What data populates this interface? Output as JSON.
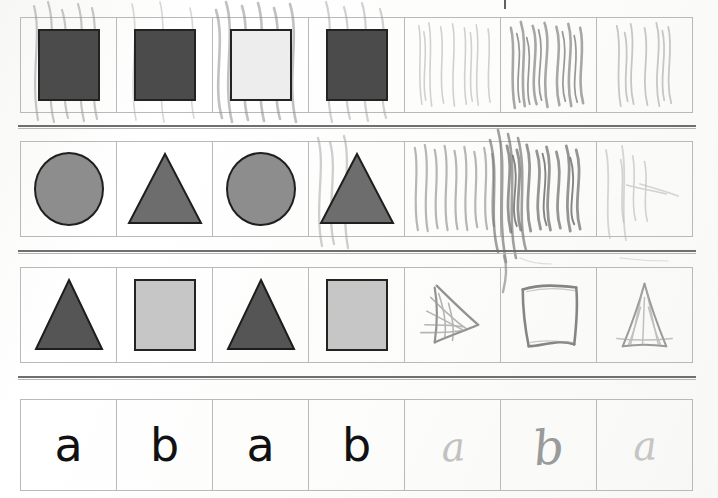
{
  "document": {
    "type": "scanned-worksheet",
    "title": "AB Pattern Practice Worksheet",
    "description": "Scanned student worksheet with four pattern rows of seven cells each; first four cells are printed pattern shapes or letters, last three are hand-drawn pencil answers."
  },
  "colors": {
    "shape_dark": "#4b4b4b",
    "shape_mid": "#8d8d8d",
    "shape_light": "#c6c6c6",
    "triangle_dark": "#555555",
    "triangle_mid": "#6d6d6d",
    "grid_line": "#b9b9b9",
    "separator_line": "#6f6f6f",
    "pencil": "#9a9a9a",
    "letter_ink": "#111111",
    "paper": "#ffffff"
  },
  "rows": [
    {
      "id": "row-squares",
      "name": "square-pattern-row",
      "pattern": "AB",
      "cells": [
        {
          "kind": "square",
          "fill": "dark",
          "label": "dark square",
          "student": false,
          "scribbled": true
        },
        {
          "kind": "square",
          "fill": "dark",
          "label": "dark square",
          "student": false,
          "scribbled": false
        },
        {
          "kind": "square",
          "fill": "scribbled",
          "label": "square covered in pencil scribble",
          "student": false,
          "scribbled": true
        },
        {
          "kind": "square",
          "fill": "dark",
          "label": "dark square",
          "student": false,
          "scribbled": true
        },
        {
          "kind": "scribble",
          "fill": "none",
          "label": "light pencil scribble",
          "student": true,
          "scribbled": true
        },
        {
          "kind": "scribble",
          "fill": "none",
          "label": "heavy pencil scribble",
          "student": true,
          "scribbled": true
        },
        {
          "kind": "scribble",
          "fill": "none",
          "label": "light pencil scribble",
          "student": true,
          "scribbled": true
        }
      ]
    },
    {
      "id": "row-circle-triangle",
      "name": "circle-triangle-pattern-row",
      "pattern": "AB",
      "cells": [
        {
          "kind": "circle",
          "fill": "mid",
          "label": "gray circle",
          "student": false,
          "scribbled": false
        },
        {
          "kind": "triangle",
          "fill": "mid",
          "label": "gray triangle",
          "student": false,
          "scribbled": false
        },
        {
          "kind": "circle",
          "fill": "mid",
          "label": "gray circle",
          "student": false,
          "scribbled": false
        },
        {
          "kind": "triangle",
          "fill": "mid",
          "label": "gray triangle",
          "student": false,
          "scribbled": false
        },
        {
          "kind": "scribble",
          "fill": "none",
          "label": "pencil scribble",
          "student": true,
          "scribbled": true
        },
        {
          "kind": "scribble",
          "fill": "none",
          "label": "heavy pencil scribble",
          "student": true,
          "scribbled": true
        },
        {
          "kind": "scribble",
          "fill": "none",
          "label": "faint pencil scribble",
          "student": true,
          "scribbled": true
        }
      ]
    },
    {
      "id": "row-triangle-square",
      "name": "triangle-square-pattern-row",
      "pattern": "AB",
      "cells": [
        {
          "kind": "triangle",
          "fill": "dark",
          "label": "dark triangle",
          "student": false,
          "scribbled": false
        },
        {
          "kind": "square",
          "fill": "light",
          "label": "light gray square",
          "student": false,
          "scribbled": false
        },
        {
          "kind": "triangle",
          "fill": "dark",
          "label": "dark triangle",
          "student": false,
          "scribbled": false
        },
        {
          "kind": "square",
          "fill": "light",
          "label": "light gray square",
          "student": false,
          "scribbled": false
        },
        {
          "kind": "drawn-triangle",
          "fill": "none",
          "label": "hand drawn triangle",
          "student": true,
          "scribbled": false
        },
        {
          "kind": "drawn-square",
          "fill": "none",
          "label": "hand drawn square",
          "student": true,
          "scribbled": false
        },
        {
          "kind": "drawn-triangle",
          "fill": "none",
          "label": "hand drawn triangle",
          "student": true,
          "scribbled": false
        }
      ]
    },
    {
      "id": "row-letters",
      "name": "letter-pattern-row",
      "pattern": "AB",
      "cells": [
        {
          "kind": "letter",
          "text": "a",
          "label": "printed letter a",
          "student": false
        },
        {
          "kind": "letter",
          "text": "b",
          "label": "printed letter b",
          "student": false
        },
        {
          "kind": "letter",
          "text": "a",
          "label": "printed letter a",
          "student": false
        },
        {
          "kind": "letter",
          "text": "b",
          "label": "printed letter b",
          "student": false
        },
        {
          "kind": "hand-letter",
          "text": "a",
          "label": "hand written letter a",
          "student": true,
          "weight": "faint"
        },
        {
          "kind": "hand-letter",
          "text": "b",
          "label": "hand written letter b",
          "student": true,
          "weight": "strong"
        },
        {
          "kind": "hand-letter",
          "text": "a",
          "label": "hand written letter a",
          "student": true,
          "weight": "faint"
        }
      ]
    }
  ],
  "separators": [
    {
      "name": "separator-1",
      "after_row": "row-squares"
    },
    {
      "name": "separator-2",
      "after_row": "row-circle-triangle"
    },
    {
      "name": "separator-3",
      "after_row": "row-triangle-square"
    }
  ]
}
